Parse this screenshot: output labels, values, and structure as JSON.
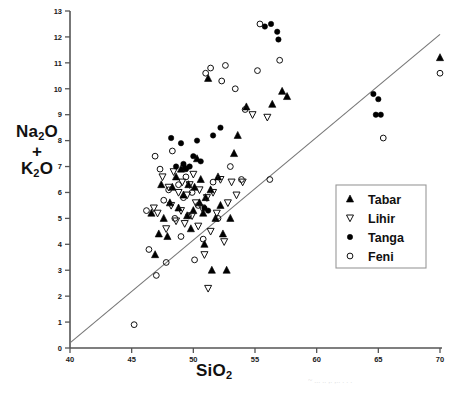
{
  "chart_data": {
    "type": "scatter",
    "title": "",
    "xlabel": "SiO2",
    "ylabel": "Na2O + K2O",
    "xlim": [
      40,
      70
    ],
    "ylim": [
      0,
      13
    ],
    "xticks": [
      40,
      45,
      50,
      55,
      60,
      65,
      70
    ],
    "yticks": [
      0,
      1,
      2,
      3,
      4,
      5,
      6,
      7,
      8,
      9,
      10,
      11,
      12,
      13
    ],
    "grid": false,
    "legend_position": "center-right",
    "annotations": [
      {
        "name": "alkaline-subalkaline-divider",
        "type": "line",
        "x0": 40.0,
        "y0": 0.2,
        "x1": 70.0,
        "y1": 12.1
      }
    ],
    "series": [
      {
        "name": "Tabar",
        "marker": "filled-triangle-up",
        "color": "#000000",
        "points": [
          [
            46.6,
            5.2
          ],
          [
            46.9,
            3.6
          ],
          [
            47.2,
            4.4
          ],
          [
            47.4,
            6.3
          ],
          [
            47.6,
            5.0
          ],
          [
            47.9,
            4.3
          ],
          [
            48.1,
            5.6
          ],
          [
            48.3,
            6.2
          ],
          [
            48.6,
            6.6
          ],
          [
            48.8,
            5.4
          ],
          [
            49.0,
            6.9
          ],
          [
            49.2,
            5.9
          ],
          [
            49.3,
            7.0
          ],
          [
            49.5,
            5.1
          ],
          [
            49.6,
            6.3
          ],
          [
            49.8,
            4.6
          ],
          [
            50.0,
            5.3
          ],
          [
            50.1,
            6.2
          ],
          [
            50.3,
            7.3
          ],
          [
            50.5,
            5.6
          ],
          [
            50.6,
            6.5
          ],
          [
            50.8,
            5.2
          ],
          [
            50.9,
            4.0
          ],
          [
            51.0,
            5.8
          ],
          [
            51.2,
            10.4
          ],
          [
            51.4,
            6.1
          ],
          [
            51.5,
            3.0
          ],
          [
            51.8,
            5.0
          ],
          [
            52.0,
            6.6
          ],
          [
            52.2,
            5.5
          ],
          [
            52.4,
            4.4
          ],
          [
            52.7,
            3.0
          ],
          [
            53.0,
            5.0
          ],
          [
            53.3,
            7.5
          ],
          [
            53.6,
            8.2
          ],
          [
            54.3,
            9.3
          ],
          [
            56.4,
            9.4
          ],
          [
            57.2,
            9.9
          ],
          [
            57.6,
            9.7
          ],
          [
            70.0,
            11.2
          ]
        ]
      },
      {
        "name": "Lihir",
        "marker": "open-triangle-down",
        "color": "#000000",
        "points": [
          [
            46.8,
            5.4
          ],
          [
            47.1,
            5.2
          ],
          [
            47.5,
            6.6
          ],
          [
            47.8,
            4.6
          ],
          [
            48.0,
            6.2
          ],
          [
            48.2,
            5.5
          ],
          [
            48.4,
            6.8
          ],
          [
            48.6,
            4.9
          ],
          [
            48.8,
            6.0
          ],
          [
            49.0,
            5.3
          ],
          [
            49.1,
            6.4
          ],
          [
            49.3,
            4.8
          ],
          [
            49.5,
            5.9
          ],
          [
            49.7,
            6.3
          ],
          [
            49.9,
            5.1
          ],
          [
            50.0,
            6.7
          ],
          [
            50.2,
            5.6
          ],
          [
            50.4,
            4.7
          ],
          [
            50.5,
            6.1
          ],
          [
            50.7,
            5.4
          ],
          [
            50.9,
            3.6
          ],
          [
            51.1,
            5.8
          ],
          [
            51.2,
            2.3
          ],
          [
            51.4,
            4.5
          ],
          [
            51.6,
            6.0
          ],
          [
            51.9,
            5.2
          ],
          [
            52.2,
            6.5
          ],
          [
            52.5,
            4.1
          ],
          [
            52.8,
            5.6
          ],
          [
            53.1,
            6.4
          ],
          [
            53.5,
            5.9
          ],
          [
            54.0,
            6.4
          ],
          [
            54.8,
            9.0
          ],
          [
            56.0,
            8.9
          ]
        ]
      },
      {
        "name": "Tanga",
        "marker": "filled-circle",
        "color": "#000000",
        "points": [
          [
            48.2,
            8.1
          ],
          [
            48.6,
            7.0
          ],
          [
            49.0,
            7.9
          ],
          [
            49.2,
            7.1
          ],
          [
            49.4,
            6.9
          ],
          [
            49.7,
            7.0
          ],
          [
            50.0,
            7.4
          ],
          [
            50.3,
            8.0
          ],
          [
            50.6,
            7.2
          ],
          [
            50.9,
            5.4
          ],
          [
            51.2,
            5.3
          ],
          [
            51.6,
            8.2
          ],
          [
            52.2,
            8.5
          ],
          [
            55.8,
            12.4
          ],
          [
            56.3,
            12.5
          ],
          [
            56.8,
            12.2
          ],
          [
            56.9,
            11.9
          ],
          [
            64.6,
            9.8
          ],
          [
            65.0,
            9.6
          ],
          [
            64.8,
            9.0
          ],
          [
            65.2,
            9.0
          ]
        ]
      },
      {
        "name": "Feni",
        "marker": "open-circle",
        "color": "#000000",
        "points": [
          [
            45.2,
            0.9
          ],
          [
            46.2,
            5.3
          ],
          [
            46.4,
            3.8
          ],
          [
            46.9,
            7.4
          ],
          [
            47.0,
            2.8
          ],
          [
            47.3,
            6.9
          ],
          [
            47.6,
            5.7
          ],
          [
            47.8,
            3.3
          ],
          [
            48.0,
            6.1
          ],
          [
            48.3,
            7.6
          ],
          [
            48.5,
            5.0
          ],
          [
            48.8,
            6.3
          ],
          [
            49.0,
            4.3
          ],
          [
            49.2,
            5.8
          ],
          [
            49.4,
            6.6
          ],
          [
            49.6,
            5.1
          ],
          [
            49.9,
            6.0
          ],
          [
            50.1,
            3.4
          ],
          [
            50.4,
            5.5
          ],
          [
            50.8,
            4.2
          ],
          [
            51.0,
            10.6
          ],
          [
            51.4,
            10.8
          ],
          [
            51.6,
            6.4
          ],
          [
            52.0,
            5.0
          ],
          [
            52.3,
            10.3
          ],
          [
            52.6,
            10.9
          ],
          [
            53.0,
            7.0
          ],
          [
            53.4,
            10.0
          ],
          [
            53.9,
            6.5
          ],
          [
            54.2,
            9.2
          ],
          [
            55.4,
            12.5
          ],
          [
            55.2,
            10.7
          ],
          [
            56.2,
            6.5
          ],
          [
            57.0,
            11.1
          ],
          [
            65.4,
            8.1
          ],
          [
            70.0,
            10.6
          ]
        ]
      }
    ]
  },
  "axis_labels": {
    "y_line1": "Na",
    "y_sub1": "2",
    "y_line1b": "O",
    "y_plus": "+",
    "y_line2": "K",
    "y_sub2": "2",
    "y_line2b": "O",
    "x_main": "SiO",
    "x_sub": "2"
  },
  "legend": {
    "items": [
      {
        "label": "Tabar",
        "marker": "filled-triangle-up"
      },
      {
        "label": "Lihir",
        "marker": "open-triangle-down"
      },
      {
        "label": "Tanga",
        "marker": "filled-circle"
      },
      {
        "label": "Feni",
        "marker": "open-circle"
      }
    ]
  }
}
